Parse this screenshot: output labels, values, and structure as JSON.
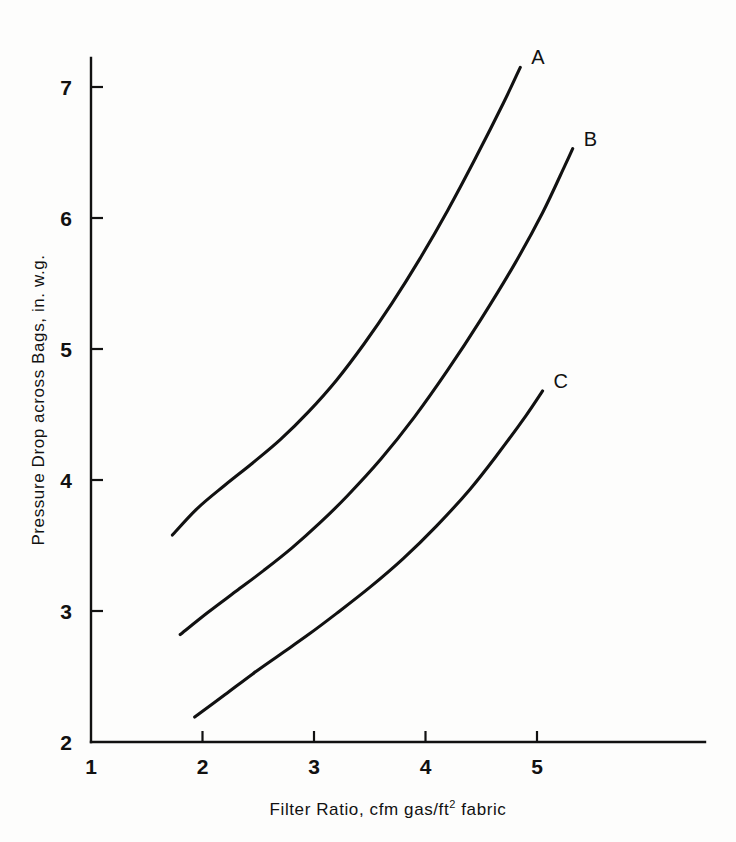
{
  "chart_data": {
    "type": "line",
    "title": "",
    "xlabel": "Filter Ratio, cfm gas/ft2 fabric",
    "xlabel_parts": {
      "before": "Filter  Ratio,  cfm  gas/ft",
      "superscript": "2",
      "after": " fabric"
    },
    "ylabel": "Pressure Drop across Bags, in. w.g.",
    "xlim": [
      1,
      6.5
    ],
    "ylim": [
      2,
      7.6
    ],
    "xticks": [
      1,
      2,
      3,
      4,
      5
    ],
    "xtick_labels": [
      "1",
      "2",
      "3",
      "4",
      "5"
    ],
    "yticks": [
      2,
      3,
      4,
      5,
      6,
      7
    ],
    "ytick_labels": [
      "2",
      "3",
      "4",
      "5",
      "6",
      "7"
    ],
    "grid": false,
    "legend": "inline-end-labels",
    "series": [
      {
        "name": "A",
        "label": "A",
        "color": "#111111",
        "points": [
          [
            1.73,
            3.58
          ],
          [
            1.95,
            3.78
          ],
          [
            2.2,
            3.96
          ],
          [
            2.45,
            4.13
          ],
          [
            2.7,
            4.31
          ],
          [
            2.95,
            4.52
          ],
          [
            3.2,
            4.76
          ],
          [
            3.45,
            5.04
          ],
          [
            3.7,
            5.35
          ],
          [
            3.95,
            5.69
          ],
          [
            4.2,
            6.06
          ],
          [
            4.45,
            6.46
          ],
          [
            4.7,
            6.88
          ],
          [
            4.85,
            7.15
          ]
        ]
      },
      {
        "name": "B",
        "label": "B",
        "color": "#111111",
        "points": [
          [
            1.8,
            2.82
          ],
          [
            2.05,
            2.99
          ],
          [
            2.3,
            3.15
          ],
          [
            2.55,
            3.31
          ],
          [
            2.8,
            3.48
          ],
          [
            3.05,
            3.67
          ],
          [
            3.3,
            3.88
          ],
          [
            3.6,
            4.16
          ],
          [
            3.9,
            4.48
          ],
          [
            4.2,
            4.84
          ],
          [
            4.5,
            5.23
          ],
          [
            4.8,
            5.65
          ],
          [
            5.05,
            6.04
          ],
          [
            5.25,
            6.4
          ],
          [
            5.32,
            6.53
          ]
        ]
      },
      {
        "name": "C",
        "label": "C",
        "color": "#111111",
        "points": [
          [
            1.93,
            2.19
          ],
          [
            2.2,
            2.36
          ],
          [
            2.45,
            2.52
          ],
          [
            2.7,
            2.67
          ],
          [
            2.95,
            2.82
          ],
          [
            3.2,
            2.98
          ],
          [
            3.5,
            3.18
          ],
          [
            3.8,
            3.4
          ],
          [
            4.1,
            3.65
          ],
          [
            4.4,
            3.93
          ],
          [
            4.65,
            4.2
          ],
          [
            4.9,
            4.49
          ],
          [
            5.05,
            4.68
          ]
        ]
      }
    ]
  }
}
